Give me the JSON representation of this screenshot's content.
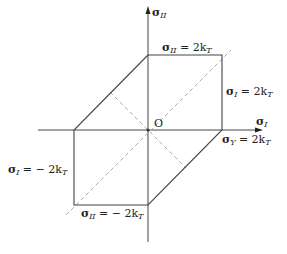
{
  "diagram": {
    "axes": {
      "x_label": {
        "symbol": "σ",
        "sub": "I"
      },
      "y_label": {
        "symbol": "σ",
        "sub": "II"
      },
      "origin_label": "O"
    },
    "labels": {
      "top": {
        "symbol": "σ",
        "sub": "II",
        "rhs": "= 2k",
        "rhs_sub": "T"
      },
      "right_upper": {
        "symbol": "σ",
        "sub": "I",
        "rhs": "= 2k",
        "rhs_sub": "T"
      },
      "right_lower": {
        "symbol": "σ",
        "sub": "Y",
        "rhs": "= 2k",
        "rhs_sub": "T"
      },
      "left": {
        "symbol": "σ",
        "sub": "I",
        "rhs": "= − 2k",
        "rhs_sub": "T"
      },
      "bottom": {
        "symbol": "σ",
        "sub": "II",
        "rhs": "= − 2k",
        "rhs_sub": "T"
      }
    },
    "colors": {
      "line": "#333333",
      "dashed": "#999999"
    }
  }
}
